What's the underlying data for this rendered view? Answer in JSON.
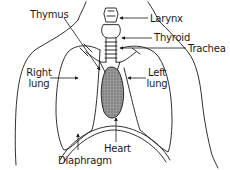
{
  "diagram": {
    "type": "anatomical-illustration",
    "labels": {
      "thymus": "Thymus",
      "larynx": "Larynx",
      "thyroid": "Thyroid",
      "trachea": "Trachea",
      "right_lung_line1": "Right",
      "right_lung_line2": "lung",
      "left_lung_line1": "Left",
      "left_lung_line2": "lung",
      "heart": "Heart",
      "diaphragm": "Diaphragm"
    },
    "colors": {
      "line": "#1a1a1a",
      "heart_fill": "#8a8a8a",
      "background": "#ffffff"
    }
  }
}
